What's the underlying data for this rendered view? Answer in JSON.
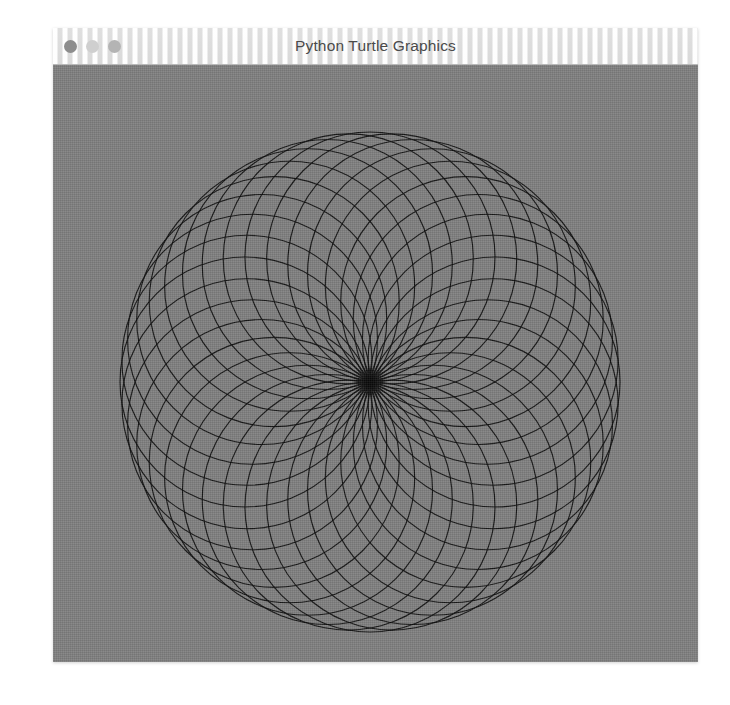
{
  "window": {
    "title": "Python Turtle Graphics",
    "controls": [
      {
        "name": "close",
        "label": "Close",
        "color": "#8d8d8d"
      },
      {
        "name": "minimize",
        "label": "Minimize",
        "color": "#cfcfcf"
      },
      {
        "name": "zoom",
        "label": "Zoom",
        "color": "#b4b4b4"
      }
    ]
  },
  "canvas": {
    "background_color": "#808080",
    "stroke_color": "#0d0d0d",
    "page_background": "#ffffff"
  },
  "chart_data": {
    "type": "line",
    "title": "Python Turtle Graphics",
    "subtitle": "Rosette of overlapping circles",
    "xlabel": "",
    "ylabel": "",
    "grid": false,
    "legend": "none",
    "pattern": "rosette",
    "center_x": 317,
    "center_y": 317,
    "outer_radius": 250,
    "circle_radius": 125,
    "circle_count": 36,
    "angle_step_degrees": 10,
    "stroke_width": 1.15,
    "stroke_color": "#0d0d0d",
    "stroke_opacity": 0.92,
    "xlim": [
      0,
      645
    ],
    "ylim": [
      0,
      597
    ],
    "annotations": [
      "All circles share a common tangency point at the center",
      "Circle centers lie on a ring of radius 125 about the center"
    ]
  }
}
